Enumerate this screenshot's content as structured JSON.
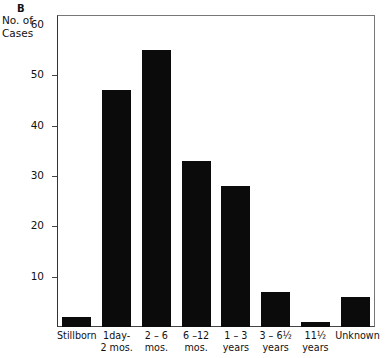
{
  "panel": {
    "letter": "B"
  },
  "axis": {
    "y_title_line1": "No. of",
    "y_title_line2": "Cases",
    "y_ticks": [
      "60",
      "50",
      "40",
      "30",
      "20",
      "10"
    ]
  },
  "chart_data": {
    "type": "bar",
    "title": "B",
    "xlabel": "",
    "ylabel": "No. of Cases",
    "ylim": [
      0,
      62
    ],
    "yticks": [
      10,
      20,
      30,
      40,
      50,
      60
    ],
    "grid": false,
    "legend": "none",
    "categories": [
      "Stillborn",
      "1 day-2 mos.",
      "2-6 mos.",
      "6-12 mos.",
      "1-3 years",
      "3-6½ years",
      "11½ years",
      "Unknown"
    ],
    "category_labels": [
      {
        "line1": "Stillborn",
        "line2": ""
      },
      {
        "line1": "1day-",
        "line2": "2 mos."
      },
      {
        "line1": "2 – 6",
        "line2": "mos."
      },
      {
        "line1": "6 –12",
        "line2": "mos."
      },
      {
        "line1": "1 – 3",
        "line2": "years"
      },
      {
        "line1": "3 – 6½",
        "line2": "years"
      },
      {
        "line1": "11½",
        "line2": "years"
      },
      {
        "line1": "Unknown",
        "line2": ""
      }
    ],
    "values": [
      2,
      47,
      55,
      33,
      28,
      7,
      1,
      6
    ],
    "bar_color": "#0b0b0b"
  }
}
